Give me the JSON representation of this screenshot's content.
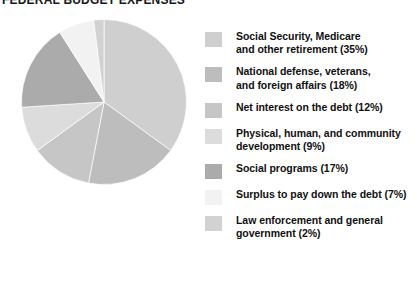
{
  "title": "FEDERAL BUDGET EXPENSES",
  "chart_data": {
    "type": "pie",
    "title": "FEDERAL BUDGET EXPENSES",
    "xlabel": "",
    "ylabel": "",
    "legend_position": "right",
    "grid": false,
    "units": "percent",
    "start_angle_deg": 0,
    "direction": "clockwise",
    "categories": [
      "Social Security, Medicare and other retirement",
      "National defense, veterans, and foreign affairs",
      "Net interest on the debt",
      "Physical, human, and community development",
      "Social programs",
      "Surplus to pay down the debt",
      "Law enforcement and general government"
    ],
    "values": [
      35,
      18,
      12,
      9,
      17,
      7,
      2
    ],
    "colors": [
      "#cfcfcf",
      "#bdbdbd",
      "#c6c6c6",
      "#dcdcdc",
      "#ababab",
      "#f2f2f2",
      "#d2d2d2"
    ]
  },
  "legend": {
    "items": [
      {
        "label": "Social Security, Medicare and other retirement (35%)",
        "line1": "Social Security, Medicare",
        "line2": "and other retirement (35%)",
        "value": 35,
        "color": "#cfcfcf",
        "swatch_name": "legend-swatch-social-security"
      },
      {
        "label": "National defense, veterans, and foreign affairs (18%)",
        "line1": "National defense, veterans,",
        "line2": "and foreign affairs (18%)",
        "value": 18,
        "color": "#bdbdbd",
        "swatch_name": "legend-swatch-national-defense"
      },
      {
        "label": "Net interest on the debt (12%)",
        "line1": "Net interest on the debt (12%)",
        "line2": "",
        "value": 12,
        "color": "#c6c6c6",
        "swatch_name": "legend-swatch-net-interest"
      },
      {
        "label": "Physical, human, and community development (9%)",
        "line1": "Physical, human, and community",
        "line2": "development (9%)",
        "value": 9,
        "color": "#dcdcdc",
        "swatch_name": "legend-swatch-physical-human-community"
      },
      {
        "label": "Social programs (17%)",
        "line1": "Social programs (17%)",
        "line2": "",
        "value": 17,
        "color": "#ababab",
        "swatch_name": "legend-swatch-social-programs"
      },
      {
        "label": "Surplus to pay down the debt (7%)",
        "line1": "Surplus to pay down the debt (7%)",
        "line2": "",
        "value": 7,
        "color": "#f2f2f2",
        "swatch_name": "legend-swatch-surplus"
      },
      {
        "label": "Law enforcement and general government (2%)",
        "line1": "Law enforcement and general",
        "line2": "government (2%)",
        "value": 2,
        "color": "#d2d2d2",
        "swatch_name": "legend-swatch-law-enforcement"
      }
    ]
  }
}
